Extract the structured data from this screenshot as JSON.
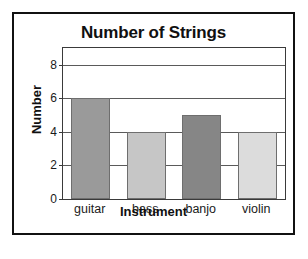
{
  "chart_data": {
    "type": "bar",
    "title": "Number of Strings",
    "xlabel": "Instrument",
    "ylabel": "Number",
    "categories": [
      "guitar",
      "bass",
      "banjo",
      "violin"
    ],
    "values": [
      6,
      4,
      5,
      4
    ],
    "ylim": [
      0,
      9
    ],
    "yticks": [
      0,
      2,
      4,
      6,
      8
    ],
    "ytick_labels": [
      "0",
      "2",
      "4",
      "6",
      "8"
    ],
    "gridlines": [
      2,
      4,
      6,
      8
    ],
    "grid": true,
    "legend": null,
    "bar_colors": [
      "#9a9a9a",
      "#c6c6c6",
      "#868686",
      "#dcdcdc"
    ],
    "bar_edge_color": "#6e6e6e",
    "frame_color": "#3a3a3a",
    "outer_border_color": "#111111",
    "background": "#ffffff"
  }
}
